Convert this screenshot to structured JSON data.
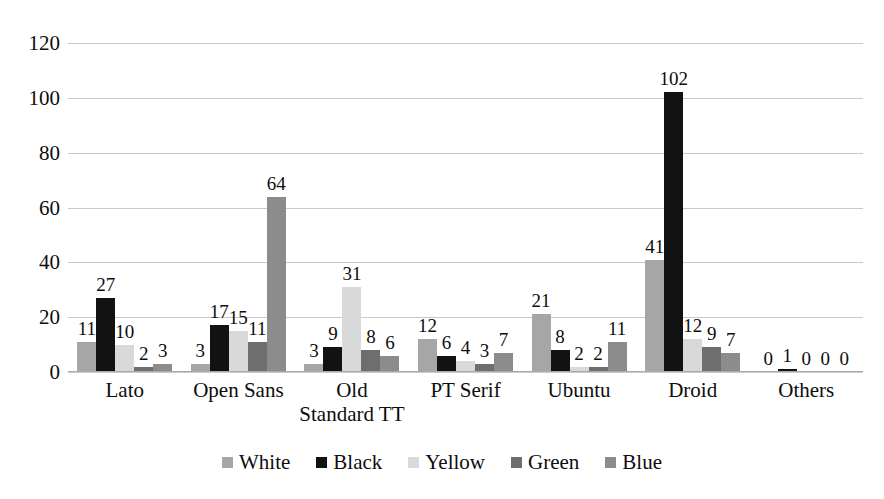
{
  "chart_data": {
    "type": "bar",
    "title": "",
    "xlabel": "",
    "ylabel": "",
    "ylim": [
      0,
      120
    ],
    "yticks": [
      0,
      20,
      40,
      60,
      80,
      100,
      120
    ],
    "grid": true,
    "legend_position": "bottom",
    "categories": [
      "Lato",
      "Open Sans",
      "Old Standard TT",
      "PT Serif",
      "Ubuntu",
      "Droid",
      "Others"
    ],
    "series": [
      {
        "name": "White",
        "color": "#a6a6a6",
        "values": [
          11,
          3,
          3,
          12,
          21,
          41,
          0
        ]
      },
      {
        "name": "Black",
        "color": "#121212",
        "values": [
          27,
          17,
          9,
          6,
          8,
          102,
          1
        ]
      },
      {
        "name": "Yellow",
        "color": "#d9d9d9",
        "values": [
          10,
          15,
          31,
          4,
          2,
          12,
          0
        ]
      },
      {
        "name": "Green",
        "color": "#6e6e6e",
        "values": [
          2,
          11,
          8,
          3,
          2,
          9,
          0
        ]
      },
      {
        "name": "Blue",
        "color": "#8c8c8c",
        "values": [
          3,
          64,
          6,
          7,
          11,
          7,
          0
        ]
      }
    ]
  },
  "axis": {
    "y_tick_labels": [
      "0",
      "20",
      "40",
      "60",
      "80",
      "100",
      "120"
    ]
  },
  "legend": {
    "items": [
      {
        "label": "White"
      },
      {
        "label": "Black"
      },
      {
        "label": "Yellow"
      },
      {
        "label": "Green"
      },
      {
        "label": "Blue"
      }
    ]
  }
}
